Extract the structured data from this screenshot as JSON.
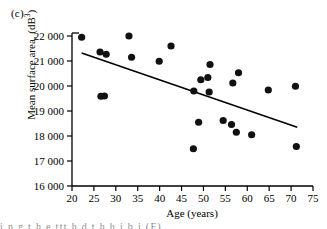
{
  "figure": {
    "panel_label": "(c)",
    "caption_bleed": "i  n  g     t  h  e                     ttt  h     d  t  h                 h              i  b  i  (F)"
  },
  "chart_data": {
    "type": "scatter",
    "title": "",
    "panel": "(c)",
    "xlabel": "Age (years)",
    "ylabel": "Mean surface area, (dB³)",
    "ylabel_base": "Mean surface area, (dB",
    "ylabel_exponent": "3",
    "ylabel_close": ")",
    "xlim": [
      20,
      75
    ],
    "ylim": [
      16000,
      22000
    ],
    "xticks": [
      20,
      25,
      30,
      35,
      40,
      45,
      50,
      55,
      60,
      65,
      70,
      75
    ],
    "xtick_labels": [
      "20",
      "25",
      "30",
      "35",
      "40",
      "45",
      "50",
      "55",
      "60",
      "65",
      "70",
      "75"
    ],
    "yticks": [
      16000,
      17000,
      18000,
      19000,
      20000,
      21000,
      22000
    ],
    "ytick_labels": [
      "16 000",
      "17 000",
      "18 000",
      "19 000",
      "20 000",
      "21 000",
      "22 000"
    ],
    "grid": false,
    "legend": null,
    "marker": {
      "shape": "circle",
      "color": "#111111",
      "size": 3.6
    },
    "points": [
      {
        "x": 22.2,
        "y": 21950
      },
      {
        "x": 26.4,
        "y": 21360
      },
      {
        "x": 26.6,
        "y": 19590
      },
      {
        "x": 27.4,
        "y": 19600
      },
      {
        "x": 27.8,
        "y": 21270
      },
      {
        "x": 33.0,
        "y": 22000
      },
      {
        "x": 33.6,
        "y": 21150
      },
      {
        "x": 39.9,
        "y": 20990
      },
      {
        "x": 42.6,
        "y": 21600
      },
      {
        "x": 47.7,
        "y": 17490
      },
      {
        "x": 47.8,
        "y": 19800
      },
      {
        "x": 48.9,
        "y": 18550
      },
      {
        "x": 49.4,
        "y": 20250
      },
      {
        "x": 51.0,
        "y": 20340
      },
      {
        "x": 51.3,
        "y": 19760
      },
      {
        "x": 51.5,
        "y": 20860
      },
      {
        "x": 54.5,
        "y": 18620
      },
      {
        "x": 56.4,
        "y": 18460
      },
      {
        "x": 56.7,
        "y": 20120
      },
      {
        "x": 57.5,
        "y": 18150
      },
      {
        "x": 58.0,
        "y": 20530
      },
      {
        "x": 61.0,
        "y": 18050
      },
      {
        "x": 64.8,
        "y": 19840
      },
      {
        "x": 71.0,
        "y": 19990
      },
      {
        "x": 71.2,
        "y": 17580
      }
    ],
    "trendline": {
      "type": "linear-fit",
      "x_start": 22.2,
      "y_start": 21320,
      "x_end": 71.4,
      "y_end": 18350,
      "color": "#000000",
      "width": 1.6
    }
  }
}
